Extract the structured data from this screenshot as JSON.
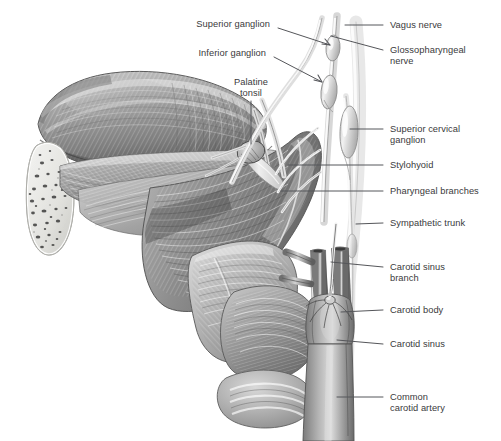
{
  "figure": {
    "style": "grayscale anatomical illustration",
    "background_color": "#ffffff",
    "label_color": "#3a3a3c",
    "leader_color": "#55565a"
  },
  "labels": {
    "left": [
      {
        "id": "superior-ganglion",
        "text": "Superior ganglion",
        "x": 191,
        "y": 19,
        "lx": 278,
        "ly": 28,
        "tx": 330,
        "ty": 45,
        "arrow": true
      },
      {
        "id": "inferior-ganglion",
        "text": "Inferior ganglion",
        "x": 196,
        "y": 48,
        "lx": 274,
        "ly": 57,
        "tx": 322,
        "ty": 82,
        "arrow": true
      },
      {
        "id": "palatine-tonsil",
        "text": "Palatine\ntonsil",
        "x": 222,
        "y": 77,
        "lx": 251,
        "ly": 101,
        "tx": 251,
        "ty": 146,
        "arrow": false
      }
    ],
    "right": [
      {
        "id": "vagus-nerve",
        "text": "Vagus nerve",
        "x": 390,
        "y": 20,
        "lx": 383,
        "ly": 25,
        "tx": 345,
        "ty": 25
      },
      {
        "id": "glossopharyngeal-nerve",
        "text": "Glossopharyngeal\nnerve",
        "x": 390,
        "y": 45,
        "lx": 383,
        "ly": 50,
        "tx": 330,
        "ty": 36
      },
      {
        "id": "superior-cervical-ganglion",
        "text": "Superior cervical\nganglion",
        "x": 390,
        "y": 124,
        "lx": 383,
        "ly": 129,
        "tx": 349,
        "ty": 129
      },
      {
        "id": "stylohyoid",
        "text": "Stylohyoid",
        "x": 390,
        "y": 160,
        "lx": 383,
        "ly": 165,
        "tx": 288,
        "ty": 165
      },
      {
        "id": "pharyngeal-branches",
        "text": "Pharyngeal branches",
        "x": 390,
        "y": 186,
        "lx": 383,
        "ly": 191,
        "tx": 280,
        "ty": 191
      },
      {
        "id": "sympathetic-trunk",
        "text": "Sympathetic trunk",
        "x": 390,
        "y": 218,
        "lx": 383,
        "ly": 223,
        "tx": 356,
        "ty": 224
      },
      {
        "id": "carotid-sinus-branch",
        "text": "Carotid sinus\nbranch",
        "x": 390,
        "y": 262,
        "lx": 383,
        "ly": 267,
        "tx": 330,
        "ty": 262
      },
      {
        "id": "carotid-body",
        "text": "Carotid body",
        "x": 390,
        "y": 305,
        "lx": 383,
        "ly": 310,
        "tx": 340,
        "ty": 312
      },
      {
        "id": "carotid-sinus",
        "text": "Carotid sinus",
        "x": 390,
        "y": 339,
        "lx": 383,
        "ly": 344,
        "tx": 337,
        "ty": 339
      },
      {
        "id": "common-carotid-artery",
        "text": "Common\ncarotid artery",
        "x": 390,
        "y": 392,
        "lx": 383,
        "ly": 397,
        "tx": 336,
        "ty": 397
      }
    ]
  }
}
